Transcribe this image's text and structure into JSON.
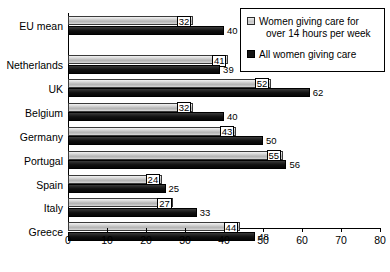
{
  "chart_data": {
    "type": "bar",
    "orientation": "horizontal",
    "title": "",
    "xlabel": "",
    "ylabel": "",
    "xlim": [
      0,
      80
    ],
    "xticks": [
      "0",
      "10",
      "20",
      "30",
      "40",
      "50",
      "60",
      "70",
      "80"
    ],
    "xtick_step": 10,
    "grid": false,
    "legend_position": "top-right",
    "categories": [
      "EU mean",
      "Netherlands",
      "UK",
      "Belgium",
      "Germany",
      "Portugal",
      "Spain",
      "Italy",
      "Greece"
    ],
    "series": [
      {
        "name": "Women giving care for over 14 hours per week",
        "color": "#c9c9c9",
        "values": [
          32,
          41,
          52,
          32,
          43,
          55,
          24,
          27,
          44
        ],
        "labels": [
          "32",
          "41",
          "52",
          "32",
          "43",
          "55",
          "24",
          "27",
          "44"
        ]
      },
      {
        "name": "All women giving care",
        "color": "#101010",
        "values": [
          40,
          39,
          62,
          40,
          50,
          56,
          25,
          33,
          48
        ],
        "labels": [
          "40",
          "39",
          "62",
          "40",
          "50",
          "56",
          "25",
          "33",
          "48"
        ]
      }
    ]
  },
  "legend": {
    "items": [
      {
        "line1": "Women giving care for",
        "line2": "over 14 hours per week",
        "swatch": "light-gradient-swatch"
      },
      {
        "line1": "All women giving care",
        "line2": "",
        "swatch": "dark-solid-swatch"
      }
    ]
  }
}
